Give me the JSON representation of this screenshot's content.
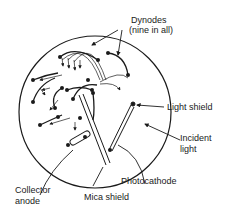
{
  "diagram": {
    "labels": {
      "dynodes": "Dynodes",
      "dynodes_note": "(nine in all)",
      "light_shield": "Light shield",
      "incident": "Incident",
      "light": "light",
      "photocathode": "Photocathode",
      "collector": "Collector",
      "anode": "anode",
      "mica_shield": "Mica shield"
    },
    "colors": {
      "ink": "#1a1a1a",
      "background": "#ffffff"
    }
  }
}
